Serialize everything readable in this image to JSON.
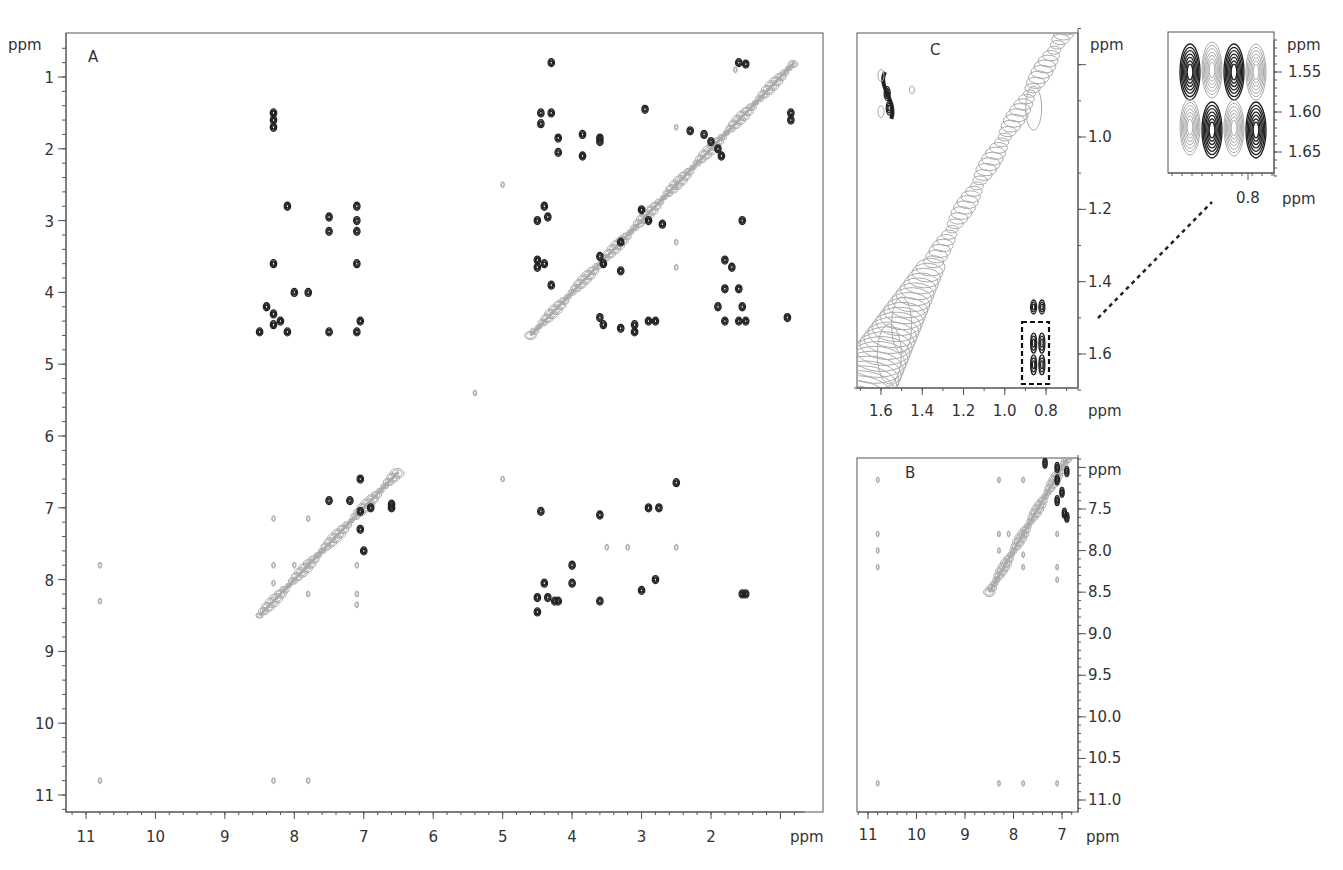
{
  "chart_data": [
    {
      "panel": "A",
      "type": "heatmap",
      "subtype": "2D NMR contour (full spectrum)",
      "title": "A",
      "xlabel": "ppm",
      "ylabel": "ppm",
      "xlim": [
        11.3,
        0.7
      ],
      "ylim": [
        0.6,
        11.2
      ],
      "xticks": [
        "11",
        "10",
        "9",
        "8",
        "7",
        "6",
        "5",
        "4",
        "3",
        "2"
      ],
      "yticks": [
        "1",
        "2",
        "3",
        "4",
        "5",
        "6",
        "7",
        "8",
        "9",
        "10",
        "11"
      ],
      "diagonal": {
        "from": [
          8.5,
          8.5
        ],
        "to": [
          6.5,
          6.5
        ],
        "from2": [
          4.6,
          4.6
        ],
        "to2": [
          0.8,
          0.8
        ]
      },
      "positive_peaks": [
        [
          8.3,
          1.5
        ],
        [
          8.3,
          1.6
        ],
        [
          8.3,
          1.7
        ],
        [
          7.1,
          2.8
        ],
        [
          7.1,
          3.0
        ],
        [
          8.1,
          2.8
        ],
        [
          7.5,
          2.95
        ],
        [
          7.5,
          3.15
        ],
        [
          7.1,
          3.15
        ],
        [
          8.3,
          3.6
        ],
        [
          7.1,
          3.6
        ],
        [
          8.0,
          4.0
        ],
        [
          7.8,
          4.0
        ],
        [
          8.4,
          4.2
        ],
        [
          8.3,
          4.3
        ],
        [
          8.2,
          4.4
        ],
        [
          8.3,
          4.45
        ],
        [
          8.5,
          4.55
        ],
        [
          8.1,
          4.55
        ],
        [
          7.5,
          4.55
        ],
        [
          7.1,
          4.55
        ],
        [
          7.05,
          4.4
        ],
        [
          4.3,
          0.8
        ],
        [
          1.6,
          0.8
        ],
        [
          1.5,
          0.82
        ],
        [
          0.85,
          1.5
        ],
        [
          0.85,
          1.6
        ],
        [
          4.45,
          1.5
        ],
        [
          4.45,
          1.65
        ],
        [
          4.3,
          1.5
        ],
        [
          2.95,
          1.45
        ],
        [
          4.2,
          1.85
        ],
        [
          3.85,
          1.8
        ],
        [
          3.6,
          1.85
        ],
        [
          3.6,
          1.9
        ],
        [
          4.2,
          2.05
        ],
        [
          3.85,
          2.1
        ],
        [
          2.3,
          1.75
        ],
        [
          2.1,
          1.8
        ],
        [
          2.0,
          1.9
        ],
        [
          1.9,
          2.0
        ],
        [
          1.85,
          2.1
        ],
        [
          4.4,
          2.8
        ],
        [
          4.35,
          2.95
        ],
        [
          4.5,
          3.0
        ],
        [
          3.0,
          2.85
        ],
        [
          2.9,
          3.0
        ],
        [
          2.7,
          3.05
        ],
        [
          3.3,
          3.3
        ],
        [
          4.5,
          3.55
        ],
        [
          4.4,
          3.6
        ],
        [
          3.6,
          3.5
        ],
        [
          3.55,
          3.6
        ],
        [
          3.3,
          3.7
        ],
        [
          4.3,
          3.9
        ],
        [
          4.5,
          3.65
        ],
        [
          1.55,
          3.0
        ],
        [
          1.8,
          3.55
        ],
        [
          1.7,
          3.65
        ],
        [
          1.8,
          3.95
        ],
        [
          1.6,
          3.95
        ],
        [
          1.55,
          4.2
        ],
        [
          1.9,
          4.2
        ],
        [
          3.6,
          4.35
        ],
        [
          3.55,
          4.45
        ],
        [
          3.1,
          4.45
        ],
        [
          2.9,
          4.4
        ],
        [
          2.8,
          4.4
        ],
        [
          3.3,
          4.5
        ],
        [
          3.1,
          4.55
        ],
        [
          1.8,
          4.4
        ],
        [
          1.6,
          4.4
        ],
        [
          1.5,
          4.4
        ],
        [
          0.9,
          4.35
        ],
        [
          7.05,
          6.6
        ],
        [
          7.5,
          6.9
        ],
        [
          7.2,
          6.9
        ],
        [
          6.9,
          7.0
        ],
        [
          7.05,
          7.05
        ],
        [
          7.05,
          7.3
        ],
        [
          6.6,
          7.0
        ],
        [
          6.6,
          6.95
        ],
        [
          7.0,
          7.6
        ],
        [
          4.45,
          7.05
        ],
        [
          3.6,
          7.1
        ],
        [
          2.9,
          7.0
        ],
        [
          2.75,
          7.0
        ],
        [
          2.5,
          6.65
        ],
        [
          4.0,
          7.8
        ],
        [
          4.0,
          8.05
        ],
        [
          4.4,
          8.05
        ],
        [
          4.5,
          8.25
        ],
        [
          4.35,
          8.25
        ],
        [
          4.25,
          8.3
        ],
        [
          4.2,
          8.3
        ],
        [
          4.5,
          8.45
        ],
        [
          3.6,
          8.3
        ],
        [
          3.0,
          8.15
        ],
        [
          2.8,
          8.0
        ],
        [
          1.5,
          8.2
        ],
        [
          1.55,
          8.2
        ]
      ],
      "negative_peaks": [
        [
          10.8,
          7.8
        ],
        [
          10.8,
          8.3
        ],
        [
          10.8,
          10.8
        ],
        [
          8.3,
          10.8
        ],
        [
          7.8,
          10.8
        ],
        [
          8.3,
          7.15
        ],
        [
          7.8,
          7.15
        ],
        [
          8.3,
          7.8
        ],
        [
          8.0,
          7.8
        ],
        [
          7.8,
          7.8
        ],
        [
          7.1,
          7.8
        ],
        [
          8.3,
          8.05
        ],
        [
          7.8,
          8.2
        ],
        [
          7.1,
          8.2
        ],
        [
          7.1,
          8.35
        ],
        [
          5.0,
          2.5
        ],
        [
          5.4,
          5.4
        ],
        [
          5.0,
          6.6
        ],
        [
          2.5,
          7.55
        ],
        [
          2.5,
          1.7
        ],
        [
          2.5,
          2.5
        ],
        [
          2.5,
          3.3
        ],
        [
          2.5,
          3.65
        ],
        [
          1.65,
          0.9
        ],
        [
          3.5,
          7.55
        ],
        [
          3.2,
          7.55
        ]
      ]
    },
    {
      "panel": "B",
      "type": "heatmap",
      "subtype": "2D NMR contour (amide/aromatic region expansion)",
      "title": "B",
      "xlabel": "ppm",
      "ylabel": "ppm",
      "xlim": [
        11.2,
        6.8
      ],
      "ylim": [
        6.85,
        11.15
      ],
      "xticks": [
        "11",
        "10",
        "9",
        "8",
        "7"
      ],
      "yticks": [
        "ppm",
        "7.5",
        "8.0",
        "8.5",
        "9.0",
        "9.5",
        "10.0",
        "10.5",
        "11.0"
      ],
      "positive_peaks": [
        [
          7.35,
          6.95
        ],
        [
          7.1,
          7.0
        ],
        [
          7.1,
          7.15
        ],
        [
          6.9,
          7.05
        ],
        [
          6.9,
          7.6
        ],
        [
          7.0,
          7.3
        ],
        [
          7.1,
          7.4
        ],
        [
          6.95,
          7.55
        ]
      ],
      "negative_peaks": [
        [
          10.8,
          7.15
        ],
        [
          10.8,
          7.8
        ],
        [
          10.8,
          8.0
        ],
        [
          10.8,
          8.2
        ],
        [
          10.8,
          10.8
        ],
        [
          8.3,
          7.15
        ],
        [
          7.8,
          7.15
        ],
        [
          8.3,
          7.8
        ],
        [
          8.1,
          7.8
        ],
        [
          7.8,
          7.8
        ],
        [
          7.1,
          7.8
        ],
        [
          8.3,
          8.0
        ],
        [
          7.8,
          8.05
        ],
        [
          7.8,
          8.2
        ],
        [
          7.1,
          8.2
        ],
        [
          7.1,
          8.35
        ],
        [
          8.3,
          10.8
        ],
        [
          7.8,
          10.8
        ],
        [
          7.1,
          10.8
        ]
      ]
    },
    {
      "panel": "C",
      "type": "heatmap",
      "subtype": "2D NMR contour (aliphatic region expansion)",
      "title": "C",
      "xlabel": "ppm",
      "ylabel": "ppm",
      "xlim": [
        1.73,
        0.65
      ],
      "ylim": [
        0.8,
        1.7
      ],
      "xticks": [
        "1.6",
        "1.4",
        "1.2",
        "1.0",
        "0.8"
      ],
      "yticks": [
        "1.0",
        "1.2",
        "1.4",
        "1.6"
      ],
      "positive_peaks": [
        [
          1.57,
          0.88
        ],
        [
          1.56,
          0.92
        ],
        [
          0.86,
          1.47
        ],
        [
          0.82,
          1.47
        ],
        [
          0.86,
          1.57
        ],
        [
          0.82,
          1.57
        ],
        [
          0.86,
          1.63
        ],
        [
          0.82,
          1.63
        ]
      ],
      "negative_peaks": [
        [
          1.45,
          0.86
        ],
        [
          0.9,
          0.9
        ]
      ],
      "highlight_box": {
        "x": [
          0.91,
          0.78
        ],
        "y": [
          1.53,
          1.69
        ],
        "style": "dashed"
      }
    },
    {
      "panel": "inset",
      "type": "heatmap",
      "subtype": "2D NMR contour (zoom of dashed box in C)",
      "title": "",
      "xlabel": "ppm",
      "ylabel": "ppm",
      "xticks": [
        "0.8"
      ],
      "yticks": [
        "ppm",
        "1.55",
        "1.60",
        "1.65"
      ],
      "ylim": [
        1.51,
        1.68
      ]
    }
  ],
  "labels": {
    "panel_a": "A",
    "panel_b": "B",
    "panel_c": "C",
    "ppm": "ppm",
    "a_x": [
      "11",
      "10",
      "9",
      "8",
      "7",
      "6",
      "5",
      "4",
      "3",
      "2"
    ],
    "a_y": [
      "1",
      "2",
      "3",
      "4",
      "5",
      "6",
      "7",
      "8",
      "9",
      "10",
      "11"
    ],
    "b_x": [
      "11",
      "10",
      "9",
      "8",
      "7"
    ],
    "b_y": [
      "7.5",
      "8.0",
      "8.5",
      "9.0",
      "9.5",
      "10.0",
      "10.5",
      "11.0"
    ],
    "c_x": [
      "1.6",
      "1.4",
      "1.2",
      "1.0",
      "0.8"
    ],
    "c_y": [
      "1.0",
      "1.2",
      "1.4",
      "1.6"
    ],
    "inset_x": [
      "0.8"
    ],
    "inset_y": [
      "1.55",
      "1.60",
      "1.65"
    ]
  }
}
